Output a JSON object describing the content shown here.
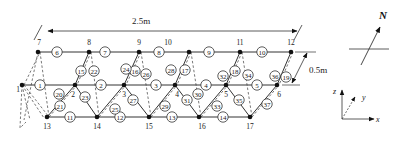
{
  "diagram": {
    "dimensions": {
      "length": "2.5m",
      "width": "0.5m"
    },
    "north_label": "N",
    "axes": {
      "x": "x",
      "y": "y",
      "z": "z"
    },
    "nodes": [
      {
        "id": "1",
        "x": 22,
        "y": 85,
        "lx": 18,
        "ly": 92
      },
      {
        "id": "2",
        "x": 75,
        "y": 85,
        "lx": 73,
        "ly": 97
      },
      {
        "id": "3",
        "x": 124,
        "y": 85,
        "lx": 124,
        "ly": 97
      },
      {
        "id": "4",
        "x": 175,
        "y": 85,
        "lx": 177,
        "ly": 97
      },
      {
        "id": "5",
        "x": 226,
        "y": 85,
        "lx": 226,
        "ly": 97
      },
      {
        "id": "6",
        "x": 277,
        "y": 85,
        "lx": 279,
        "ly": 97
      },
      {
        "id": "7",
        "x": 38,
        "y": 52,
        "lx": 39,
        "ly": 45
      },
      {
        "id": "8",
        "x": 89,
        "y": 52,
        "lx": 89,
        "ly": 45
      },
      {
        "id": "9",
        "x": 139,
        "y": 52,
        "lx": 139,
        "ly": 45
      },
      {
        "id": "10",
        "x": 189,
        "y": 52,
        "lx": 168,
        "ly": 45
      },
      {
        "id": "11",
        "x": 240,
        "y": 52,
        "lx": 240,
        "ly": 45
      },
      {
        "id": "12",
        "x": 291,
        "y": 52,
        "lx": 291,
        "ly": 45
      },
      {
        "id": "13",
        "x": 47,
        "y": 117,
        "lx": 47,
        "ly": 129
      },
      {
        "id": "14",
        "x": 97,
        "y": 117,
        "lx": 97,
        "ly": 129
      },
      {
        "id": "15",
        "x": 149,
        "y": 117,
        "lx": 149,
        "ly": 129
      },
      {
        "id": "16",
        "x": 199,
        "y": 117,
        "lx": 202,
        "ly": 129
      },
      {
        "id": "17",
        "x": 250,
        "y": 117,
        "lx": 250,
        "ly": 129
      }
    ],
    "members": [
      {
        "id": "1",
        "x": 40,
        "y": 85
      },
      {
        "id": "2",
        "x": 101,
        "y": 85
      },
      {
        "id": "3",
        "x": 156,
        "y": 85
      },
      {
        "id": "4",
        "x": 206,
        "y": 85
      },
      {
        "id": "5",
        "x": 257,
        "y": 85
      },
      {
        "id": "6",
        "x": 57,
        "y": 52
      },
      {
        "id": "7",
        "x": 105,
        "y": 52
      },
      {
        "id": "8",
        "x": 159,
        "y": 52
      },
      {
        "id": "9",
        "x": 209,
        "y": 52
      },
      {
        "id": "10",
        "x": 262,
        "y": 52
      },
      {
        "id": "11",
        "x": 70,
        "y": 117
      },
      {
        "id": "12",
        "x": 120,
        "y": 117
      },
      {
        "id": "13",
        "x": 172,
        "y": 117
      },
      {
        "id": "14",
        "x": 223,
        "y": 117
      },
      {
        "id": "15",
        "x": 81,
        "y": 71
      },
      {
        "id": "16",
        "x": 135,
        "y": 71
      },
      {
        "id": "17",
        "x": 185,
        "y": 70
      },
      {
        "id": "18",
        "x": 235,
        "y": 71
      },
      {
        "id": "19",
        "x": 286,
        "y": 77
      },
      {
        "id": "20",
        "x": 59,
        "y": 94
      },
      {
        "id": "21",
        "x": 60,
        "y": 106
      },
      {
        "id": "22",
        "x": 94,
        "y": 71
      },
      {
        "id": "23",
        "x": 85,
        "y": 97
      },
      {
        "id": "24",
        "x": 126,
        "y": 69
      },
      {
        "id": "25",
        "x": 115,
        "y": 109
      },
      {
        "id": "26",
        "x": 146,
        "y": 74
      },
      {
        "id": "27",
        "x": 133,
        "y": 100
      },
      {
        "id": "28",
        "x": 171,
        "y": 70
      },
      {
        "id": "29",
        "x": 165,
        "y": 106
      },
      {
        "id": "30",
        "x": 198,
        "y": 94
      },
      {
        "id": "31",
        "x": 187,
        "y": 100
      },
      {
        "id": "32",
        "x": 223,
        "y": 76
      },
      {
        "id": "33",
        "x": 217,
        "y": 106
      },
      {
        "id": "34",
        "x": 248,
        "y": 75
      },
      {
        "id": "35",
        "x": 239,
        "y": 100
      },
      {
        "id": "36",
        "x": 275,
        "y": 76
      },
      {
        "id": "37",
        "x": 267,
        "y": 104
      }
    ]
  }
}
